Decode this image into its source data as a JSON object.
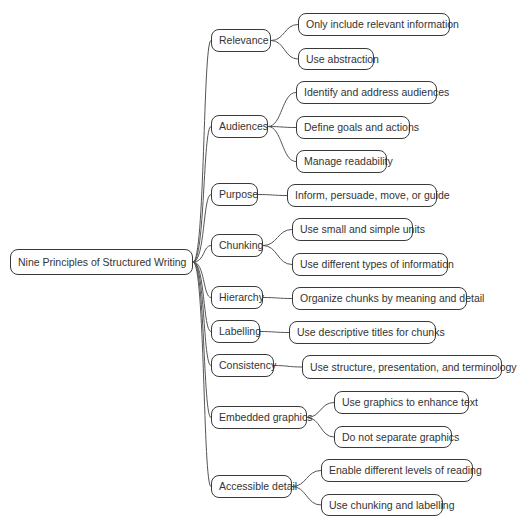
{
  "mindmap": {
    "root": {
      "label": "Nine Principles of Structured Writing",
      "x": 10,
      "y": 249,
      "w": 183,
      "h": 26
    },
    "branches": [
      {
        "label": "Relevance",
        "x": 211,
        "y": 29,
        "w": 60,
        "h": 23,
        "children": [
          {
            "label": "Only include relevant information",
            "x": 298,
            "y": 13,
            "w": 152,
            "h": 23
          },
          {
            "label": "Use abstraction",
            "x": 298,
            "y": 48,
            "w": 76,
            "h": 22
          }
        ]
      },
      {
        "label": "Audiences",
        "x": 211,
        "y": 115,
        "w": 57,
        "h": 23,
        "children": [
          {
            "label": "Identify and address audiences",
            "x": 296,
            "y": 81,
            "w": 141,
            "h": 23
          },
          {
            "label": "Define goals and actions",
            "x": 296,
            "y": 116,
            "w": 114,
            "h": 23
          },
          {
            "label": "Manage readability",
            "x": 296,
            "y": 150,
            "w": 91,
            "h": 23
          }
        ]
      },
      {
        "label": "Purpose",
        "x": 211,
        "y": 183,
        "w": 47,
        "h": 23,
        "children": [
          {
            "label": "Inform, persuade, move, or guide",
            "x": 287,
            "y": 184,
            "w": 150,
            "h": 23
          }
        ]
      },
      {
        "label": "Chunking",
        "x": 211,
        "y": 234,
        "w": 52,
        "h": 23,
        "children": [
          {
            "label": "Use small and simple units",
            "x": 292,
            "y": 218,
            "w": 121,
            "h": 23
          },
          {
            "label": "Use different types of information",
            "x": 292,
            "y": 253,
            "w": 156,
            "h": 23
          }
        ]
      },
      {
        "label": "Hierarchy",
        "x": 211,
        "y": 286,
        "w": 52,
        "h": 23,
        "children": [
          {
            "label": "Organize chunks by meaning and detail",
            "x": 292,
            "y": 287,
            "w": 175,
            "h": 23
          }
        ]
      },
      {
        "label": "Labelling",
        "x": 211,
        "y": 320,
        "w": 49,
        "h": 23,
        "children": [
          {
            "label": "Use descriptive titles for chunks",
            "x": 289,
            "y": 321,
            "w": 147,
            "h": 23
          }
        ]
      },
      {
        "label": "Consistency",
        "x": 211,
        "y": 354,
        "w": 63,
        "h": 23,
        "children": [
          {
            "label": "Use structure, presentation, and terminology",
            "x": 302,
            "y": 355,
            "w": 200,
            "h": 24
          }
        ]
      },
      {
        "label": "Embedded graphics",
        "x": 211,
        "y": 406,
        "w": 96,
        "h": 23,
        "children": [
          {
            "label": "Use graphics to enhance text",
            "x": 334,
            "y": 391,
            "w": 135,
            "h": 23
          },
          {
            "label": "Do not separate graphics",
            "x": 334,
            "y": 426,
            "w": 118,
            "h": 22
          }
        ]
      },
      {
        "label": "Accessible detail",
        "x": 211,
        "y": 475,
        "w": 81,
        "h": 23,
        "children": [
          {
            "label": "Enable different levels of reading",
            "x": 321,
            "y": 459,
            "w": 152,
            "h": 23
          },
          {
            "label": "Use chunking and labelling",
            "x": 321,
            "y": 494,
            "w": 122,
            "h": 22
          }
        ]
      }
    ],
    "colors": {
      "line": "#555555",
      "border": "#3a3a3a",
      "text": "#333333",
      "background": "#ffffff"
    }
  }
}
